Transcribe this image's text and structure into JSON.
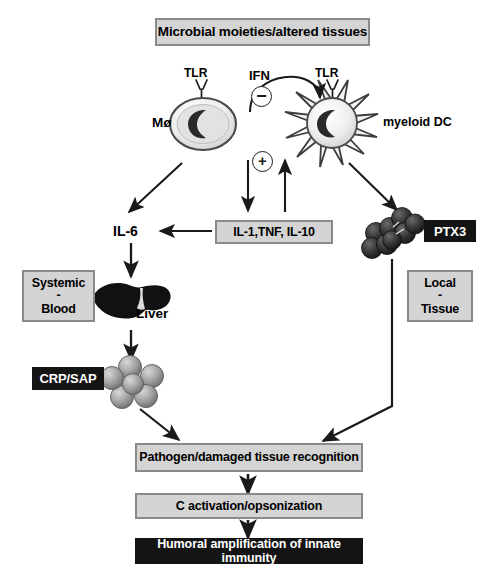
{
  "diagram": {
    "title_box": "Microbial moieties/altered tissues",
    "cells": {
      "macrophage_label": "Mø",
      "macrophage_receptor_label": "TLR",
      "dc_label": "myeloid DC",
      "dc_receptor_label": "TLR"
    },
    "signals": {
      "ifn_label": "IFN",
      "inhibit_symbol": "⊖",
      "activate_symbol": "⊕"
    },
    "mediators": {
      "il6_label": "IL-6",
      "cytokine_box": "IL-1,TNF, IL-10",
      "ptx3_label": "PTX3",
      "crp_sap_label": "CRP/SAP"
    },
    "compartments": {
      "systemic": {
        "line1": "Systemic",
        "divider": "-",
        "line2": "Blood"
      },
      "local": {
        "line1": "Local",
        "divider": "-",
        "line2": "Tissue"
      }
    },
    "organs": {
      "liver_label": "Liver"
    },
    "outcomes": [
      "Pathogen/damaged tissue recognition",
      "C activation/opsonization",
      "Humoral amplification of innate immunity"
    ],
    "colors": {
      "box_fill": "#d4d4d4",
      "box_border": "#8a8a8a",
      "black_fill": "#141414",
      "sphere_light": "#9a9a9a",
      "sphere_dark": "#2e2e2e",
      "arrow": "#1a1a1a"
    }
  }
}
